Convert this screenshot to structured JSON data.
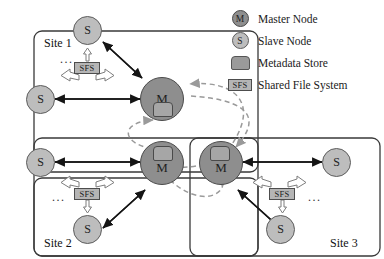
{
  "page_header": {
    "text": "",
    "visible_fragment": true
  },
  "legend": {
    "items": [
      {
        "icon": "master-node-icon",
        "icon_label": "M",
        "label": "Master Node"
      },
      {
        "icon": "slave-node-icon",
        "icon_label": "S",
        "label": "Slave Node"
      },
      {
        "icon": "metadata-store-icon",
        "icon_label": "",
        "label": "Metadata Store"
      },
      {
        "icon": "shared-file-system-icon",
        "icon_label": "SFS",
        "label": "Shared File System"
      }
    ]
  },
  "colors": {
    "master_fill": "#8e8e8e",
    "slave_fill": "#bdbdbd",
    "metadata_fill": "#a6a6a6",
    "sfs_fill": "#b5b5b5",
    "panel_border": "#3a3a3a",
    "solid_arrow": "#1a1a1a",
    "hollow_arrow_stroke": "#7a7a7a",
    "dashed_arrow": "#9a9a9a"
  },
  "sites": [
    {
      "id": "site-1",
      "label": "Site 1",
      "ellipsis": "...",
      "master": {
        "label": "M",
        "has_metadata_store": true
      },
      "slaves": [
        {
          "label": "S"
        },
        {
          "label": "S"
        }
      ],
      "sfs": {
        "label": "SFS"
      }
    },
    {
      "id": "site-2",
      "label": "Site 2",
      "ellipsis": "...",
      "master": {
        "label": "M",
        "has_metadata_store": true
      },
      "slaves": [
        {
          "label": "S"
        },
        {
          "label": "S"
        }
      ],
      "sfs": {
        "label": "SFS"
      }
    },
    {
      "id": "site-3",
      "label": "Site 3",
      "ellipsis": "...",
      "master": {
        "label": "M",
        "has_metadata_store": true
      },
      "slaves": [
        {
          "label": "S"
        },
        {
          "label": "S"
        }
      ],
      "sfs": {
        "label": "SFS"
      }
    }
  ],
  "inter_site_links": {
    "style": "dashed",
    "description": "Master nodes of the three sites are interconnected by dashed curved arrows"
  }
}
